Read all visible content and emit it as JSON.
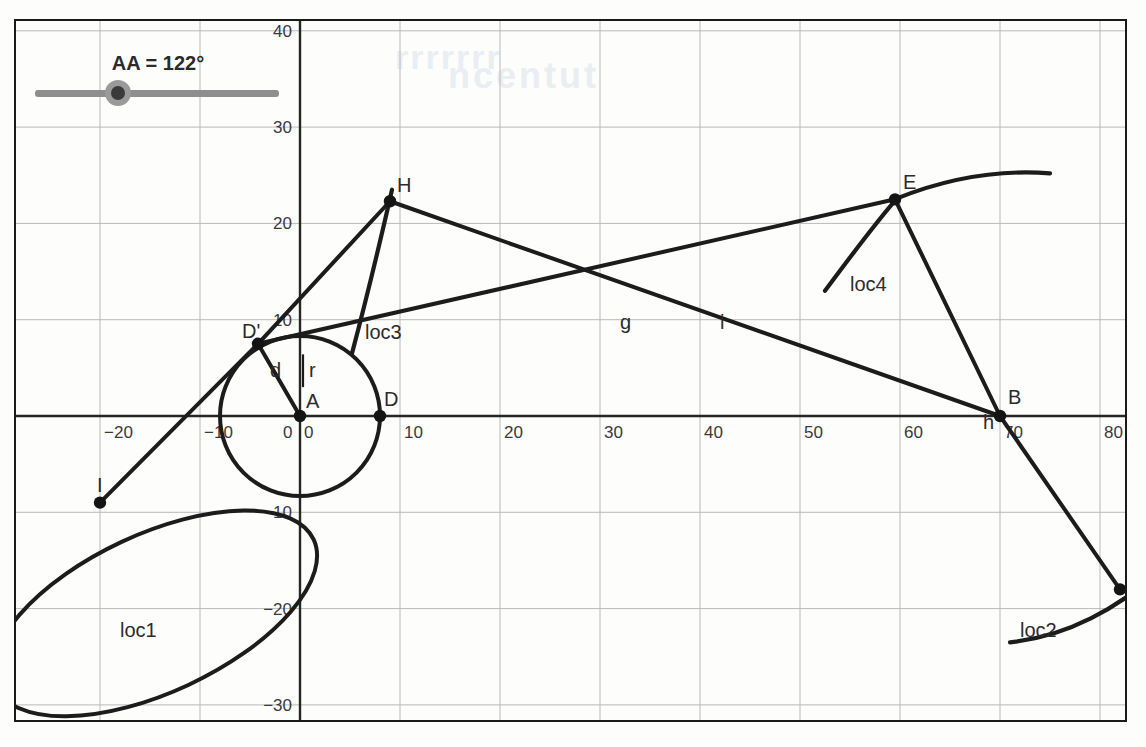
{
  "app": {
    "title": "Geometry Construction Canvas"
  },
  "slider": {
    "name": "AA",
    "label": "AA = 122°",
    "value": 122,
    "unit": "°",
    "min": 0,
    "max": 360,
    "knob_fraction": 0.34
  },
  "bleed_text": {
    "a": "rrrrrrr",
    "b": "ncentut",
    "c": ""
  },
  "chart_data": {
    "type": "scatter",
    "title": "",
    "xlabel": "",
    "ylabel": "",
    "xlim": [
      -32,
      88
    ],
    "ylim": [
      -34,
      42
    ],
    "grid": true,
    "grid_step": 10,
    "legend": "none",
    "x_ticks": [
      -30,
      -20,
      -10,
      0,
      10,
      20,
      30,
      40,
      50,
      60,
      70,
      80
    ],
    "x_tick_labels": [
      "0",
      "−20",
      "−10",
      "0",
      "10",
      "20",
      "30",
      "40",
      "50",
      "60",
      "70",
      "80"
    ],
    "y_ticks": [
      40,
      30,
      20,
      10,
      0,
      -10,
      -20,
      -30
    ],
    "y_tick_labels": [
      "40",
      "30",
      "20",
      "10",
      "0",
      "−10",
      "−20",
      "−30"
    ],
    "points": [
      {
        "label": "A",
        "x": 0,
        "y": 0,
        "label_dx": 6,
        "label_dy": -8
      },
      {
        "label": "D",
        "x": 8,
        "y": 0,
        "label_dx": 4,
        "label_dy": -10
      },
      {
        "label": "D'",
        "x": -4.2,
        "y": 7.5,
        "label_dx": -16,
        "label_dy": -6
      },
      {
        "label": "H",
        "x": 9.0,
        "y": 22.3,
        "label_dx": 7,
        "label_dy": -9
      },
      {
        "label": "E",
        "x": 59.5,
        "y": 22.5,
        "label_dx": 8,
        "label_dy": -10
      },
      {
        "label": "B",
        "x": 70.0,
        "y": 0.0,
        "label_dx": 8,
        "label_dy": -12
      },
      {
        "label": "I",
        "x": -20.0,
        "y": -9.0,
        "label_dx": -3,
        "label_dy": -11
      },
      {
        "label": "J",
        "x": 82.0,
        "y": -18.0,
        "label_dx": 5,
        "label_dy": -10
      }
    ],
    "segment_labels": [
      {
        "label": "g",
        "x": 32.0,
        "y": 9.0
      },
      {
        "label": "i",
        "x": 42.0,
        "y": 9.0
      },
      {
        "label": "d",
        "x": -3.0,
        "y": 4.0
      },
      {
        "label": "r",
        "x": 0.9,
        "y": 4.1
      },
      {
        "label": "h",
        "x": 68.3,
        "y": -1.4
      }
    ],
    "locus_labels": [
      {
        "label": "loc1",
        "x": -18.0,
        "y": -23.0
      },
      {
        "label": "loc2",
        "x": 72.0,
        "y": -23.0
      },
      {
        "label": "loc3",
        "x": 6.5,
        "y": 8.0
      },
      {
        "label": "loc4",
        "x": 55.0,
        "y": 13.0
      }
    ],
    "segments": [
      {
        "name": "I-D'",
        "from": [
          -20.0,
          -9.0
        ],
        "to": [
          -4.2,
          7.5
        ]
      },
      {
        "name": "D'-H",
        "from": [
          -4.2,
          7.5
        ],
        "to": [
          9.0,
          22.3
        ]
      },
      {
        "name": "H-B",
        "from": [
          9.0,
          22.3
        ],
        "to": [
          70.0,
          0.0
        ]
      },
      {
        "name": "D'-E",
        "from": [
          -4.2,
          7.5
        ],
        "to": [
          59.5,
          22.5
        ]
      },
      {
        "name": "E-B",
        "from": [
          59.5,
          22.5
        ],
        "to": [
          70.0,
          0.0
        ]
      },
      {
        "name": "B-J",
        "from": [
          70.0,
          0.0
        ],
        "to": [
          82.0,
          -18.0
        ]
      },
      {
        "name": "A-D'",
        "from": [
          0,
          0
        ],
        "to": [
          -4.2,
          7.5
        ]
      }
    ],
    "circle": {
      "name": "circle-A",
      "center": [
        0,
        0
      ],
      "radius": 8.0
    },
    "ellipse": {
      "name": "loc1-ellipse",
      "center": [
        -14.5,
        -20.5
      ],
      "rx": 17.5,
      "ry": 8.2,
      "rotation_deg": 25
    },
    "arcs": [
      {
        "name": "loc2",
        "d_units": "M 71,-23.5 C 76,-23.0 82,-20.5 88,-14.0"
      },
      {
        "name": "loc3",
        "d_units": "M 5.2,6.5 C 6.6,12.0 8.0,18.0 9.2,23.5"
      },
      {
        "name": "loc4-left",
        "d_units": "M 52.5,13.0 C 55,16.5 57.5,20.0 59.7,22.6"
      },
      {
        "name": "loc4-right",
        "d_units": "M 59.7,22.6 C 65,24.8 70,25.6 75,25.2"
      }
    ]
  }
}
